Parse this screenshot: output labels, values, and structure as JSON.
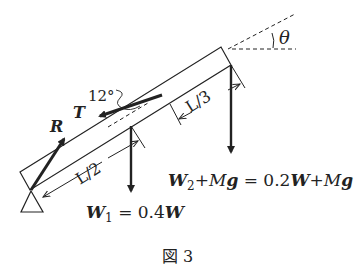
{
  "figure": {
    "caption": "図 3",
    "caption_prefix": "図",
    "caption_number": "3"
  },
  "labels": {
    "angle_theta": "θ",
    "angle_12": "12°",
    "tension": "T",
    "reaction": "R",
    "half_length": "L/2",
    "third_length": "L/3",
    "w1_sym": "W",
    "w1_sub": "1",
    "w1_rhs": " = 0.4",
    "w1_rhs_w": "W",
    "w2_sym": "W",
    "w2_sub": "2",
    "w2_plus": "+",
    "w2_M": "M",
    "w2_g": "g",
    "w2_eq": " = 0.2",
    "w2_W": "W",
    "w2_plus2": "+",
    "w2_M2": "M",
    "w2_g2": "g"
  },
  "colors": {
    "stroke": "#222222",
    "background": "#ffffff"
  }
}
